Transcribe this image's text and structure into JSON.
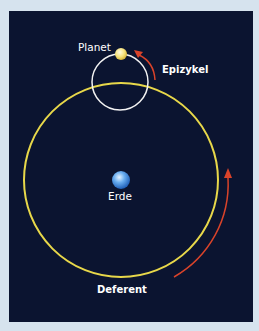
{
  "diagram": {
    "labels": {
      "planet": "Planet",
      "epicycle": "Epizykel",
      "earth": "Erde",
      "deferent": "Deferent"
    },
    "colors": {
      "background": "#0b1430",
      "page": "#d6e3ee",
      "deferent": "#e8d84a",
      "epicycle": "#f2f2f2",
      "arrow": "#d9432a",
      "planet": "#f3e27a",
      "earth": "#5aa0ea"
    }
  }
}
